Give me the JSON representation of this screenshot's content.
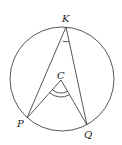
{
  "figure": {
    "circle": {
      "cx": 62,
      "cy": 79,
      "r": 52,
      "stroke": "#444444"
    },
    "points": {
      "K": {
        "label": "K",
        "x": 66,
        "y": 27
      },
      "C": {
        "label": "C",
        "x": 61,
        "y": 80
      },
      "P": {
        "label": "P",
        "x": 27,
        "y": 118
      },
      "Q": {
        "label": "Q",
        "x": 87,
        "y": 125
      }
    },
    "segments": [
      "KP",
      "KQ",
      "CP",
      "CQ"
    ],
    "angle_marks": [
      {
        "vertex": "K",
        "arcs": 1
      },
      {
        "vertex": "C",
        "arcs": 2
      }
    ]
  }
}
